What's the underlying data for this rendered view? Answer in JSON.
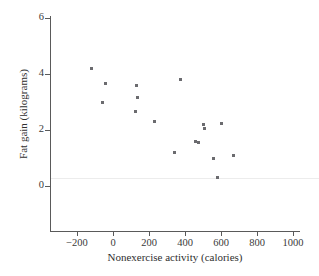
{
  "chart_data": {
    "type": "scatter",
    "title": "",
    "xlabel": "Nonexercise activity (calories)",
    "ylabel": "Fat gain (kilograms)",
    "xlim": [
      -320,
      1070
    ],
    "ylim": [
      -1.5,
      6.4
    ],
    "xticks": [
      -200,
      0,
      200,
      400,
      600,
      800,
      1000
    ],
    "xtick_labels": [
      "−200",
      "0",
      "200",
      "400",
      "600",
      "800",
      "1000"
    ],
    "yticks": [
      0,
      2,
      4,
      6
    ],
    "ytick_labels": [
      "0",
      "2",
      "4",
      "6"
    ],
    "grid": false,
    "legend": "none",
    "marker": "square",
    "marker_color": "#6b6b6f",
    "axis_color": "#5a5a5a",
    "points": [
      {
        "x": -120,
        "y": 4.2
      },
      {
        "x": -60,
        "y": 3.0
      },
      {
        "x": -40,
        "y": 3.65
      },
      {
        "x": 125,
        "y": 2.65
      },
      {
        "x": 130,
        "y": 3.6
      },
      {
        "x": 135,
        "y": 3.15
      },
      {
        "x": 230,
        "y": 2.3
      },
      {
        "x": 340,
        "y": 1.2
      },
      {
        "x": 375,
        "y": 3.8
      },
      {
        "x": 460,
        "y": 1.6
      },
      {
        "x": 475,
        "y": 1.55
      },
      {
        "x": 505,
        "y": 2.2
      },
      {
        "x": 510,
        "y": 2.05
      },
      {
        "x": 560,
        "y": 1.0
      },
      {
        "x": 580,
        "y": 0.3
      },
      {
        "x": 605,
        "y": 2.25
      },
      {
        "x": 670,
        "y": 1.1
      }
    ]
  }
}
